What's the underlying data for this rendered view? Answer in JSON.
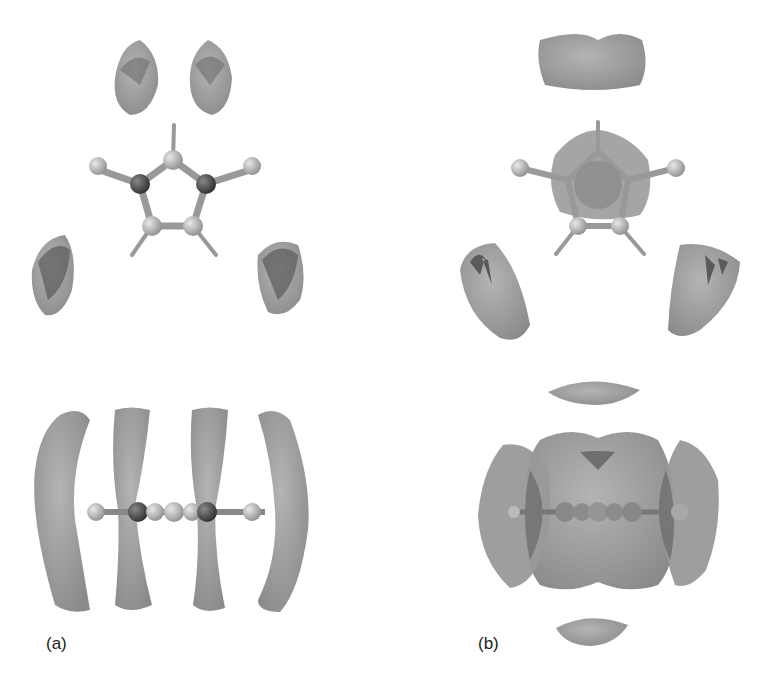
{
  "panels": [
    {
      "id": "a",
      "label": "(a)",
      "views": [
        "top view: pyrrole-like five-membered ring with four lobes",
        "side view: ring edge-on with four elongated lobes"
      ]
    },
    {
      "id": "b",
      "label": "(b)",
      "views": [
        "top view: ring with central isosurface and three lobes",
        "side view: ring edge-on with large central isosurface, side lobes, top and bottom caps"
      ]
    }
  ],
  "colors": {
    "surface": "#9a9a9a",
    "surface_dark": "#6e6e6e",
    "atom_light": "#b8b8b8",
    "atom_dark": "#555555",
    "bond": "#8a8a8a"
  }
}
